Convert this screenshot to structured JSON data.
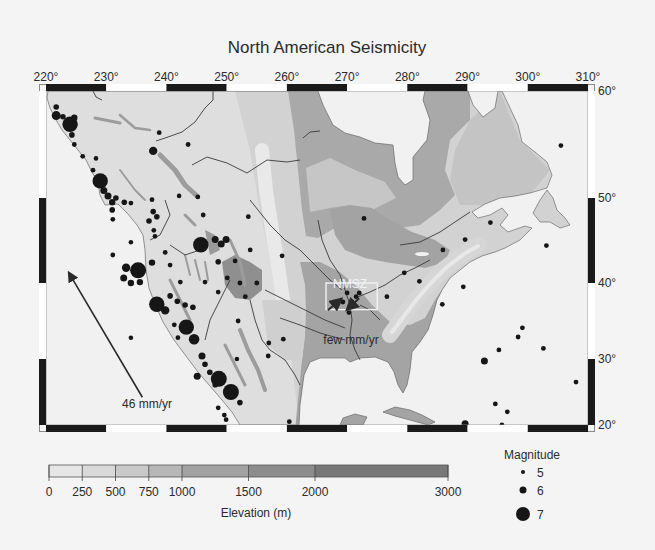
{
  "title": "North American Seismicity",
  "colorbar": {
    "label": "Elevation (m)",
    "ticks": [
      "0",
      "250",
      "500",
      "750",
      "1000",
      "1500",
      "2000",
      "3000"
    ]
  },
  "legend": {
    "title": "Magnitude",
    "entries": [
      {
        "label": "5",
        "magnitude": 5
      },
      {
        "label": "6",
        "magnitude": 6
      },
      {
        "label": "7",
        "magnitude": 7
      }
    ]
  },
  "annotations": {
    "nmsz": "NMSZ",
    "nmsz_rate": "few mm/yr",
    "plate_rate": "46 mm/yr"
  },
  "chart_data": {
    "type": "scatter",
    "subtype": "map",
    "title": "North American Seismicity",
    "lon_ticks": [
      220,
      230,
      240,
      250,
      260,
      270,
      280,
      290,
      300,
      310
    ],
    "lon_tick_labels": [
      "220°",
      "230°",
      "240°",
      "250°",
      "260°",
      "270°",
      "280°",
      "290°",
      "300°",
      "310°"
    ],
    "lat_ticks": [
      60,
      50,
      40,
      30,
      20
    ],
    "lat_tick_labels": [
      "60°",
      "50°",
      "40°",
      "30°",
      "20°"
    ],
    "lon_range": [
      220,
      310
    ],
    "lat_range": [
      20,
      60
    ],
    "elevation_bins": [
      {
        "from": 0,
        "to": 250,
        "color": "#e6e6e6"
      },
      {
        "from": 250,
        "to": 500,
        "color": "#d9d9d9"
      },
      {
        "from": 500,
        "to": 750,
        "color": "#c9c9c9"
      },
      {
        "from": 750,
        "to": 1000,
        "color": "#b7b7b7"
      },
      {
        "from": 1000,
        "to": 1500,
        "color": "#a1a1a1"
      },
      {
        "from": 1500,
        "to": 2000,
        "color": "#8c8c8c"
      },
      {
        "from": 2000,
        "to": 3000,
        "color": "#787878"
      }
    ],
    "elevation_range": [
      0,
      3000
    ],
    "legend_position": "bottom-right",
    "earthquake_fields": [
      "lon",
      "lat",
      "magnitude"
    ],
    "earthquakes": [
      [
        221.7,
        58.5,
        5.5
      ],
      [
        221.7,
        57.7,
        6.3
      ],
      [
        222.8,
        57.6,
        5.5
      ],
      [
        224.0,
        56.9,
        7.2
      ],
      [
        224.7,
        57.5,
        5.8
      ],
      [
        224.3,
        55.9,
        5.5
      ],
      [
        224.7,
        55.0,
        5.3
      ],
      [
        226.1,
        53.9,
        5.3
      ],
      [
        228.3,
        53.7,
        5.2
      ],
      [
        227.8,
        52.6,
        5.3
      ],
      [
        229.0,
        51.6,
        7.2
      ],
      [
        229.6,
        50.7,
        6.0
      ],
      [
        230.3,
        50.2,
        6.0
      ],
      [
        231.0,
        49.5,
        5.8
      ],
      [
        231.6,
        50.0,
        5.5
      ],
      [
        231.0,
        48.6,
        5.5
      ],
      [
        231.1,
        47.5,
        5.3
      ],
      [
        233.0,
        49.5,
        5.5
      ],
      [
        234.1,
        49.4,
        5.3
      ],
      [
        237.8,
        54.4,
        6.2
      ],
      [
        238.8,
        56.1,
        5.3
      ],
      [
        243.6,
        55.0,
        5.3
      ],
      [
        237.6,
        49.8,
        5.3
      ],
      [
        237.8,
        48.4,
        5.5
      ],
      [
        238.4,
        47.8,
        5.5
      ],
      [
        237.1,
        47.3,
        5.5
      ],
      [
        237.9,
        46.2,
        5.3
      ],
      [
        238.1,
        45.5,
        5.3
      ],
      [
        234.1,
        44.8,
        5.2
      ],
      [
        242.1,
        50.2,
        5.2
      ],
      [
        245.2,
        50.1,
        5.3
      ],
      [
        246.1,
        48.0,
        5.3
      ],
      [
        253.6,
        47.8,
        5.3
      ],
      [
        245.7,
        44.5,
        7.2
      ],
      [
        248.1,
        45.1,
        6.0
      ],
      [
        249.1,
        44.6,
        6.0
      ],
      [
        249.9,
        45.1,
        6.0
      ],
      [
        231.1,
        43.3,
        5.3
      ],
      [
        233.3,
        41.8,
        6.2
      ],
      [
        235.3,
        41.5,
        7.3
      ],
      [
        232.9,
        40.6,
        6.0
      ],
      [
        234.1,
        40.0,
        5.8
      ],
      [
        235.6,
        40.1,
        5.8
      ],
      [
        237.6,
        42.4,
        5.8
      ],
      [
        238.4,
        37.2,
        7.2
      ],
      [
        239.8,
        36.4,
        6.2
      ],
      [
        240.6,
        38.3,
        5.5
      ],
      [
        241.8,
        37.6,
        5.5
      ],
      [
        243.1,
        37.1,
        5.5
      ],
      [
        244.4,
        36.8,
        5.5
      ],
      [
        243.3,
        34.2,
        7.2
      ],
      [
        244.6,
        32.6,
        6.5
      ],
      [
        241.3,
        34.5,
        5.3
      ],
      [
        241.9,
        32.8,
        5.3
      ],
      [
        245.9,
        30.4,
        6.0
      ],
      [
        246.4,
        29.2,
        5.5
      ],
      [
        245.1,
        27.4,
        6.0
      ],
      [
        248.7,
        27.0,
        7.3
      ],
      [
        250.7,
        25.0,
        7.3
      ],
      [
        252.2,
        23.4,
        5.5
      ],
      [
        248.6,
        22.6,
        5.3
      ],
      [
        249.6,
        21.5,
        5.3
      ],
      [
        247.2,
        28.0,
        5.5
      ],
      [
        248.1,
        26.1,
        5.5
      ],
      [
        249.9,
        20.8,
        5.3
      ],
      [
        234.1,
        32.8,
        5.2
      ],
      [
        251.7,
        30.0,
        5.2
      ],
      [
        251.9,
        35.0,
        5.3
      ],
      [
        257.0,
        32.1,
        5.3
      ],
      [
        259.4,
        32.6,
        5.3
      ],
      [
        256.9,
        30.4,
        5.3
      ],
      [
        260.4,
        20.5,
        5.3
      ],
      [
        289.6,
        20.2,
        6.0
      ],
      [
        272.8,
        47.6,
        5.3
      ],
      [
        259.2,
        43.2,
        5.3
      ],
      [
        248.6,
        42.5,
        5.5
      ],
      [
        251.4,
        42.6,
        5.3
      ],
      [
        253.9,
        43.9,
        5.3
      ],
      [
        250.1,
        40.6,
        5.3
      ],
      [
        252.2,
        40.0,
        5.3
      ],
      [
        255.0,
        40.0,
        5.3
      ],
      [
        248.6,
        38.8,
        5.3
      ],
      [
        253.1,
        38.2,
        5.3
      ],
      [
        246.4,
        40.1,
        5.3
      ],
      [
        239.8,
        43.6,
        5.3
      ],
      [
        240.6,
        42.1,
        5.3
      ],
      [
        242.3,
        40.1,
        5.3
      ],
      [
        279.5,
        41.2,
        5.3
      ],
      [
        282.0,
        40.2,
        5.3
      ],
      [
        270.0,
        38.7,
        5.3
      ],
      [
        272.0,
        38.7,
        5.3
      ],
      [
        271.5,
        38.2,
        5.3
      ],
      [
        269.3,
        37.5,
        5.3
      ],
      [
        270.8,
        37.5,
        5.3
      ],
      [
        270.3,
        36.1,
        5.3
      ],
      [
        276.6,
        38.2,
        5.3
      ],
      [
        293.8,
        47.1,
        5.3
      ],
      [
        289.6,
        45.1,
        5.3
      ],
      [
        285.9,
        43.9,
        5.3
      ],
      [
        289.3,
        39.5,
        5.3
      ],
      [
        285.8,
        37.2,
        5.3
      ],
      [
        299.1,
        34.1,
        5.3
      ],
      [
        298.4,
        32.9,
        5.3
      ],
      [
        305.5,
        54.9,
        5.3
      ],
      [
        303.1,
        44.4,
        5.3
      ],
      [
        295.2,
        31.2,
        5.3
      ],
      [
        302.6,
        31.4,
        5.3
      ],
      [
        292.8,
        29.7,
        6.0
      ],
      [
        308.0,
        26.5,
        5.3
      ],
      [
        294.6,
        23.2,
        5.3
      ],
      [
        296.6,
        22.0,
        5.3
      ],
      [
        295.7,
        20.0,
        5.3
      ]
    ],
    "nmsz_box": {
      "lon": [
        266.5,
        275.0
      ],
      "lat": [
        36.5,
        40.0
      ]
    },
    "vectors": [
      {
        "label": "46 mm/yr",
        "from": [
          236.0,
          24.2
        ],
        "to": [
          223.8,
          41.2
        ]
      },
      {
        "label": "few mm/yr",
        "from": [
          266.8,
          36.4
        ],
        "to": [
          269.0,
          37.9
        ]
      },
      {
        "label": "few mm/yr",
        "from": [
          272.0,
          38.0
        ],
        "to": [
          270.0,
          36.5
        ]
      }
    ]
  }
}
